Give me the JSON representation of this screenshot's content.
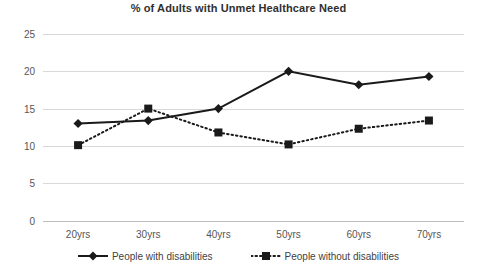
{
  "chart_data": {
    "type": "line",
    "title": "% of Adults with Unmet Healthcare Need",
    "xlabel": "",
    "ylabel": "",
    "categories": [
      "20yrs",
      "30yrs",
      "40yrs",
      "50yrs",
      "60yrs",
      "70yrs"
    ],
    "ylim": [
      0,
      25
    ],
    "yticks": [
      0,
      5,
      10,
      15,
      20,
      25
    ],
    "ytick_labels": [
      "0",
      "5",
      "10",
      "15",
      "20",
      "25"
    ],
    "grid": true,
    "legend_position": "bottom",
    "series": [
      {
        "name": "People with disabilities",
        "line_style": "solid",
        "marker": "diamond",
        "color": "#1a1a1a",
        "values": [
          13.0,
          13.4,
          15.0,
          20.0,
          18.2,
          19.3
        ]
      },
      {
        "name": "People without disabilities",
        "line_style": "dotted",
        "marker": "square",
        "color": "#1a1a1a",
        "values": [
          10.1,
          15.0,
          11.8,
          10.2,
          12.3,
          13.4
        ]
      }
    ]
  },
  "colors": {
    "series": "#1a1a1a",
    "grid": "#d9d9d9",
    "axis": "#bfbfbf",
    "text": "#565656",
    "title": "#2f2f2f",
    "background": "#ffffff"
  }
}
